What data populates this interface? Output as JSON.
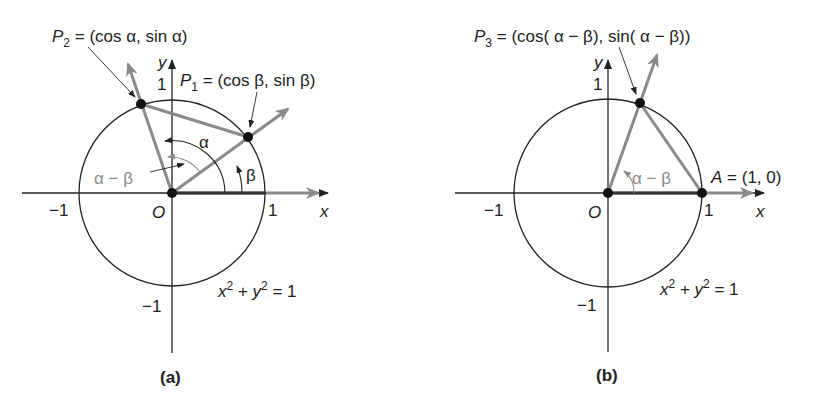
{
  "colors": {
    "ink": "#222222",
    "gray_ray": "#8a8a8a",
    "background": "#ffffff"
  },
  "panel_a": {
    "caption": "(a)",
    "p2_label": {
      "name": "P",
      "sub": "2",
      "rest": " = (cos α, sin α)"
    },
    "p1_label": {
      "name": "P",
      "sub": "1",
      "rest": " = (cos β, sin β)"
    },
    "x_axis_label": "x",
    "y_axis_label": "y",
    "origin_label": "O",
    "tick_x_pos": "1",
    "tick_x_neg": "−1",
    "tick_y_pos": "1",
    "tick_y_neg": "−1",
    "angle_alpha": "α",
    "angle_beta": "β",
    "angle_diff": "α − β",
    "equation": {
      "x": "x",
      "sup1": "2",
      "plus": " + ",
      "y": "y",
      "sup2": "2",
      "rest": " = 1"
    }
  },
  "panel_b": {
    "caption": "(b)",
    "p3_label": {
      "name": "P",
      "sub": "3",
      "rest": " = (cos( α − β), sin( α − β))"
    },
    "a_label": {
      "name": "A",
      "rest": " = (1, 0)"
    },
    "x_axis_label": "x",
    "y_axis_label": "y",
    "origin_label": "O",
    "tick_x_pos": "1",
    "tick_x_neg": "−1",
    "tick_y_pos": "1",
    "tick_y_neg": "−1",
    "angle_diff": "α − β",
    "equation": {
      "x": "x",
      "sup1": "2",
      "plus": " + ",
      "y": "y",
      "sup2": "2",
      "rest": " = 1"
    }
  }
}
